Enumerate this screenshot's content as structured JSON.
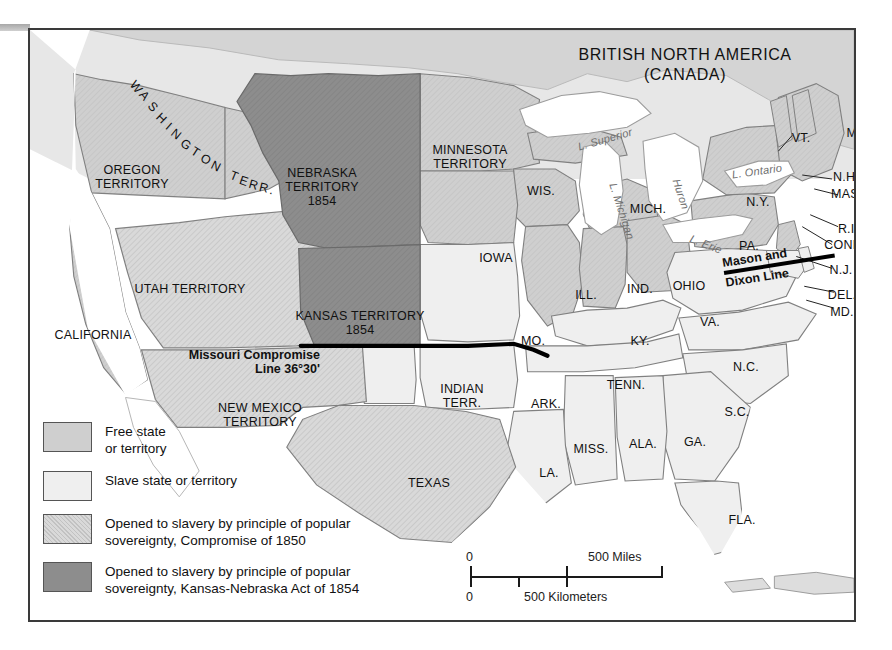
{
  "map": {
    "title_line1": "BRITISH NORTH AMERICA",
    "title_line2": "(CANADA)",
    "annotations": {
      "mason_dixon_line1": "Mason and",
      "mason_dixon_line2": "Dixon Line",
      "missouri_line1": "Missouri Compromise",
      "missouri_line2": "Line 36°30'"
    },
    "lakes": [
      {
        "name": "L. Superior",
        "x": 575,
        "y": 103,
        "rot": -16
      },
      {
        "name": "L. Michigan",
        "x": 592,
        "y": 175,
        "rot": 72
      },
      {
        "name": "Huron",
        "x": 651,
        "y": 158,
        "rot": 72
      },
      {
        "name": "L. Erie",
        "x": 676,
        "y": 208,
        "rot": 21
      },
      {
        "name": "L. Ontario",
        "x": 727,
        "y": 135,
        "rot": -8
      }
    ],
    "territories": [
      {
        "label": "OREGON\nTERRITORY",
        "x": 102,
        "y": 133
      },
      {
        "label": "WASHINGTON TERR.",
        "x": 0,
        "y": 0
      },
      {
        "label": "NEBRASKA\nTERRITORY\n1854",
        "x": 292,
        "y": 136
      },
      {
        "label": "MINNESOTA\nTERRITORY",
        "x": 440,
        "y": 113
      },
      {
        "label": "UTAH TERRITORY",
        "x": 160,
        "y": 252
      },
      {
        "label": "KANSAS TERRITORY\n1854",
        "x": 330,
        "y": 279
      },
      {
        "label": "CALIFORNIA",
        "x": 63,
        "y": 298
      },
      {
        "label": "NEW MEXICO\nTERRITORY",
        "x": 230,
        "y": 371
      },
      {
        "label": "INDIAN\nTERR.",
        "x": 432,
        "y": 352
      },
      {
        "label": "TEXAS",
        "x": 399,
        "y": 446
      }
    ],
    "states": [
      {
        "label": "WIS.",
        "x": 511,
        "y": 154
      },
      {
        "label": "MICH.",
        "x": 618,
        "y": 172
      },
      {
        "label": "IOWA",
        "x": 466,
        "y": 221
      },
      {
        "label": "ILL.",
        "x": 556,
        "y": 258
      },
      {
        "label": "IND.",
        "x": 610,
        "y": 252
      },
      {
        "label": "OHIO",
        "x": 659,
        "y": 249
      },
      {
        "label": "PA.",
        "x": 719,
        "y": 209
      },
      {
        "label": "N.Y.",
        "x": 728,
        "y": 165
      },
      {
        "label": "MO.",
        "x": 503,
        "y": 304
      },
      {
        "label": "KY.",
        "x": 610,
        "y": 304
      },
      {
        "label": "VA.",
        "x": 680,
        "y": 285
      },
      {
        "label": "TENN.",
        "x": 596,
        "y": 348
      },
      {
        "label": "N.C.",
        "x": 716,
        "y": 330
      },
      {
        "label": "ARK.",
        "x": 516,
        "y": 367
      },
      {
        "label": "S.C.",
        "x": 707,
        "y": 375
      },
      {
        "label": "MISS.",
        "x": 561,
        "y": 412
      },
      {
        "label": "ALA.",
        "x": 613,
        "y": 407
      },
      {
        "label": "GA.",
        "x": 665,
        "y": 405
      },
      {
        "label": "LA.",
        "x": 519,
        "y": 436
      },
      {
        "label": "FLA.",
        "x": 712,
        "y": 483
      }
    ],
    "callout_states": [
      {
        "label": "VT.",
        "x": 771,
        "y": 101
      },
      {
        "label": "ME.",
        "x": 828,
        "y": 96
      },
      {
        "label": "N.H.",
        "x": 816,
        "y": 140
      },
      {
        "label": "MASS.",
        "x": 821,
        "y": 157
      },
      {
        "label": "R.I.",
        "x": 818,
        "y": 192
      },
      {
        "label": "CONN.",
        "x": 815,
        "y": 208
      },
      {
        "label": "N.J.",
        "x": 811,
        "y": 233
      },
      {
        "label": "DEL.",
        "x": 812,
        "y": 258
      },
      {
        "label": "MD.",
        "x": 812,
        "y": 275
      }
    ]
  },
  "legend": {
    "items": [
      {
        "swatch": "free",
        "text": "Free state\nor territory"
      },
      {
        "swatch": "slave",
        "text": "Slave state or territory"
      },
      {
        "swatch": "pop1850",
        "text": "Opened to slavery by principle of popular\nsovereignty, Compromise of 1850"
      },
      {
        "swatch": "pop1854",
        "text": "Opened to slavery by principle of popular\nsovereignty, Kansas-Nebraska Act of 1854"
      }
    ]
  },
  "scale": {
    "miles_zero": "0",
    "miles_max": "500 Miles",
    "km_zero": "0",
    "km_max": "500 Kilometers"
  },
  "colors": {
    "free": "#cfcfcf",
    "slave": "#efefef",
    "popular_1850": "#d9d9d9",
    "kansas_nebraska_1854": "#8d8d8d",
    "canada": "#d4d4d4",
    "water": "#ffffff",
    "frame": "#3a3a3a"
  }
}
